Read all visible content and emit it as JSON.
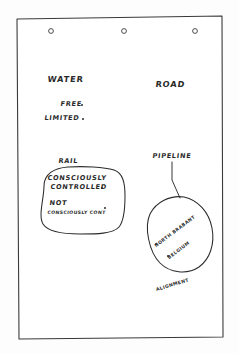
{
  "page": {
    "kind": "handwritten-flipchart-sheet",
    "ink_color": "#2b2b2b",
    "paper_color": "#fdfdfd",
    "punch_holes": 3
  },
  "categories": {
    "water": {
      "label": "WATER",
      "items": [
        {
          "label": "FREE"
        },
        {
          "label": "LIMITED"
        }
      ]
    },
    "road": {
      "label": "ROAD"
    },
    "rail": {
      "label": "RAIL",
      "items": [
        {
          "line1": "CONSCIOUSLY",
          "line2": "CONTROLLED"
        },
        {
          "line1": "NOT",
          "line2": "CONSCIOUSLY CONT"
        }
      ]
    },
    "pipeline": {
      "label": "PIPELINE",
      "items": [
        {
          "label": "NORTH BRABANT"
        },
        {
          "label": "BELGIUM"
        }
      ],
      "caption": "ALIGNMENT"
    }
  }
}
